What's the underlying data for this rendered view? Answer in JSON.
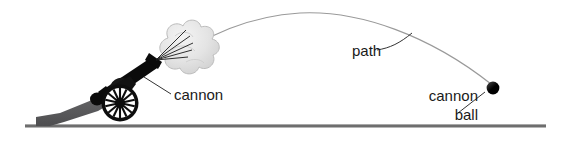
{
  "figure": {
    "background_color": "#ffffff"
  },
  "labels": {
    "cannon": "cannon",
    "path": "path",
    "cannon_ball_line1": "cannon",
    "cannon_ball_line2": "ball"
  },
  "colors": {
    "ink": "#1a1a1a",
    "leader": "#333333",
    "ground": "#6e6e6e",
    "ground_highlight": "#a8a8a8",
    "trajectory": "#9a9a9a",
    "cannon_body": "#0a0a0a",
    "cannon_trail": "#59595b",
    "smoke_fill": "#e2e2e2",
    "smoke_stroke": "#b9b9b9",
    "ball": "#000000"
  },
  "objects": {
    "cannon": {
      "name": "cannon",
      "barrel_angle_deg": -33,
      "wheel_center": [
        120,
        103
      ],
      "wheel_radius": 18,
      "spoke_count": 14
    },
    "smoke": {
      "name": "smoke-cloud",
      "center": [
        180,
        48
      ],
      "puff_count": 9
    },
    "cannon_ball": {
      "name": "cannon-ball",
      "center": [
        493,
        88
      ],
      "radius": 6
    },
    "trajectory": {
      "name": "path",
      "start": [
        172,
        62
      ],
      "apex": [
        300,
        13
      ],
      "end": [
        491,
        84
      ]
    },
    "ground": {
      "name": "ground-line",
      "y": 126,
      "x_start": 25,
      "x_end": 546
    }
  }
}
